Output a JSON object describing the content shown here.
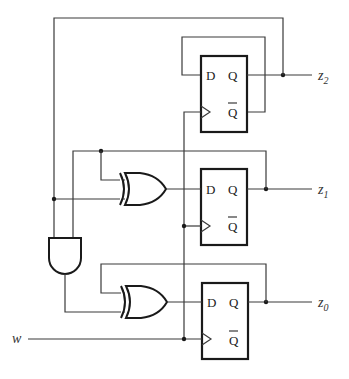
{
  "diagram": {
    "title": "",
    "type": "sequential circuit",
    "input": {
      "label": "w"
    },
    "outputs": [
      {
        "var": "z",
        "sub": "2"
      },
      {
        "var": "z",
        "sub": "1"
      },
      {
        "var": "z",
        "sub": "0"
      }
    ],
    "flipflops": [
      {
        "id": "ff2",
        "d": "D",
        "q": "Q",
        "qbar": "Q"
      },
      {
        "id": "ff1",
        "d": "D",
        "q": "Q",
        "qbar": "Q"
      },
      {
        "id": "ff0",
        "d": "D",
        "q": "Q",
        "qbar": "Q"
      }
    ],
    "gates": [
      {
        "id": "xor1",
        "type": "XOR"
      },
      {
        "id": "xor0",
        "type": "XOR"
      },
      {
        "id": "and",
        "type": "AND"
      }
    ]
  }
}
